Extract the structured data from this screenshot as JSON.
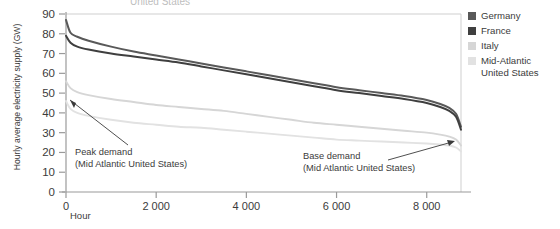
{
  "clipped_title": "United States",
  "axes": {
    "ylabel": "Hourly average electricity supply (GW)",
    "xlabel": "Hour",
    "yticks": [
      "0",
      "10",
      "20",
      "30",
      "40",
      "50",
      "60",
      "70",
      "80",
      "90"
    ],
    "xticks": [
      "0",
      "2 000",
      "4 000",
      "6 000",
      "8 000"
    ]
  },
  "legend": {
    "items": [
      {
        "label": "Germany",
        "color": "#595959"
      },
      {
        "label": "France",
        "color": "#3f3f3f"
      },
      {
        "label": "Italy",
        "color": "#d6d6d6"
      },
      {
        "label": "Mid-Atlantic\nUnited States",
        "color": "#e2e2e2"
      }
    ]
  },
  "annotations": [
    {
      "name": "peak-demand",
      "text": "Peak demand\n(Mid Atlantic United States)"
    },
    {
      "name": "base-demand",
      "text": "Base demand\n(Mid Atlantic United States)"
    }
  ],
  "chart_data": {
    "type": "line",
    "title": "",
    "xlabel": "Hour",
    "ylabel": "Hourly average electricity supply (GW)",
    "xlim": [
      0,
      8760
    ],
    "ylim": [
      0,
      90
    ],
    "xticks": [
      0,
      2000,
      4000,
      6000,
      8000
    ],
    "yticks": [
      0,
      10,
      20,
      30,
      40,
      50,
      60,
      70,
      80,
      90
    ],
    "grid": false,
    "legend_position": "right",
    "x": [
      0,
      100,
      250,
      500,
      1000,
      1500,
      2000,
      2500,
      3000,
      3500,
      4000,
      4500,
      5000,
      5500,
      6000,
      6500,
      7000,
      7500,
      8000,
      8300,
      8500,
      8650,
      8760
    ],
    "series": [
      {
        "name": "Germany",
        "color": "#595959",
        "values": [
          87,
          80.5,
          78.5,
          76.5,
          73.5,
          71,
          69,
          67,
          65,
          63,
          61,
          59,
          57,
          55,
          53,
          51.5,
          50,
          48.5,
          46.5,
          44.5,
          42.5,
          39.5,
          33
        ]
      },
      {
        "name": "France",
        "color": "#3f3f3f",
        "values": [
          79,
          75.5,
          73.5,
          72,
          70,
          68.5,
          67,
          65.5,
          63.5,
          61.5,
          59.5,
          57.5,
          55.5,
          53.5,
          51.5,
          50,
          48.5,
          47,
          45,
          43,
          41,
          38,
          31.5
        ]
      },
      {
        "name": "Italy",
        "color": "#d6d6d6",
        "values": [
          56,
          52.5,
          50.5,
          49,
          47,
          45.5,
          44,
          43,
          42,
          41,
          39.5,
          38,
          36.5,
          35,
          34,
          33,
          32,
          31,
          30,
          29,
          28,
          26.5,
          23.5
        ]
      },
      {
        "name": "Mid-Atlantic United States",
        "color": "#e2e2e2",
        "values": [
          46,
          42,
          40,
          38.5,
          36.5,
          35,
          34,
          33,
          32.5,
          31.5,
          30.5,
          29.5,
          28.5,
          27.5,
          26.5,
          26,
          25.5,
          25,
          24.5,
          24,
          23.5,
          22.5,
          20.5
        ]
      }
    ]
  }
}
